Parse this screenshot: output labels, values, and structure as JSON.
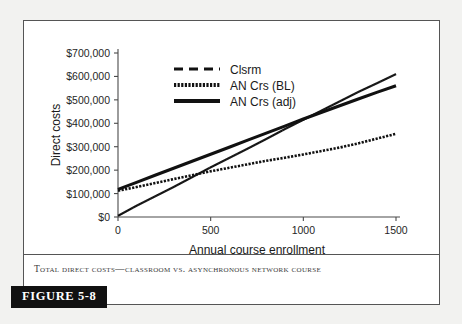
{
  "figure": {
    "banner_label": "FIGURE 5-8",
    "caption": "Total Direct Costs—Classroom vs. Asynchronous Network Course"
  },
  "chart_data": {
    "type": "line",
    "title": "",
    "xlabel": "Annual course enrollment",
    "ylabel": "Direct costs",
    "xlim": [
      0,
      1500
    ],
    "ylim": [
      0,
      700000
    ],
    "xticks": [
      0,
      500,
      1000,
      1500
    ],
    "xtick_labels": [
      "0",
      "500",
      "1000",
      "1500"
    ],
    "yticks": [
      0,
      100000,
      200000,
      300000,
      400000,
      500000,
      600000,
      700000
    ],
    "ytick_labels": [
      "$0",
      "$100,000",
      "$200,000",
      "$300,000",
      "$400,000",
      "$500,000",
      "$600,000",
      "$700,000"
    ],
    "grid": false,
    "legend_position": "upper-left-inside",
    "x": [
      0,
      100,
      200,
      300,
      400,
      500,
      600,
      700,
      800,
      900,
      1000,
      1100,
      1200,
      1300,
      1400,
      1500
    ],
    "series": [
      {
        "name": "Clsrm",
        "style": "dashed",
        "color": "#111111",
        "values": [
          5000,
          48000,
          88000,
          128000,
          170000,
          212000,
          252000,
          292000,
          333000,
          375000,
          415000,
          455000,
          495000,
          535000,
          572000,
          610000
        ]
      },
      {
        "name": "AN Crs (BL)",
        "style": "beaded",
        "color": "#111111",
        "values": [
          112000,
          128000,
          145000,
          162000,
          178000,
          195000,
          210000,
          225000,
          240000,
          253000,
          267000,
          282000,
          297000,
          315000,
          335000,
          355000
        ]
      },
      {
        "name": "AN Crs (adj)",
        "style": "solid-thick",
        "color": "#111111",
        "values": [
          118000,
          148000,
          178000,
          208000,
          238000,
          268000,
          298000,
          328000,
          358000,
          388000,
          418000,
          447000,
          476000,
          505000,
          533000,
          560000
        ]
      }
    ]
  }
}
